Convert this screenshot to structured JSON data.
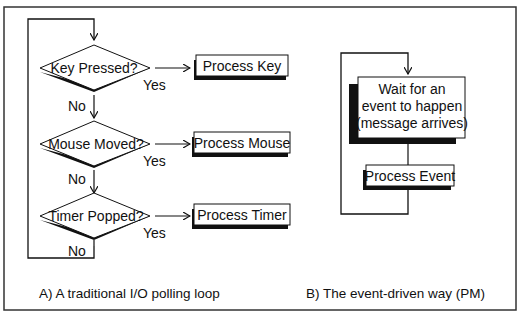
{
  "figure": {
    "panel_a": {
      "caption": "A) A traditional I/O polling loop",
      "decisions": [
        {
          "label": "Key Pressed?",
          "yes": "Yes",
          "no": "No",
          "action": "Process Key"
        },
        {
          "label": "Mouse Moved?",
          "yes": "Yes",
          "no": "No",
          "action": "Process Mouse"
        },
        {
          "label": "Timer Popped?",
          "yes": "Yes",
          "no": "No",
          "action": "Process Timer"
        }
      ]
    },
    "panel_b": {
      "caption": "B) The event-driven way (PM)",
      "wait_box": [
        "Wait for an",
        "event to happen",
        "(message arrives)"
      ],
      "process_box": "Process Event"
    }
  }
}
